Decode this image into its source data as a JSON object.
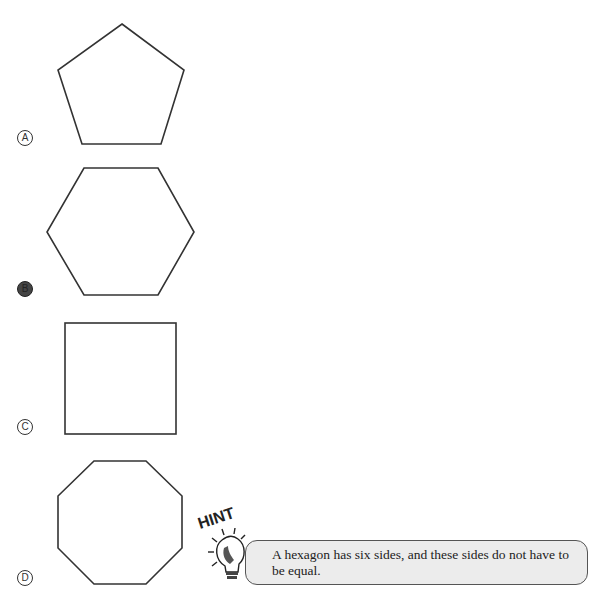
{
  "question": {
    "choices": [
      {
        "letter": "A",
        "shape": "pentagon",
        "selected": false
      },
      {
        "letter": "B",
        "shape": "hexagon",
        "selected": true
      },
      {
        "letter": "C",
        "shape": "square",
        "selected": false
      },
      {
        "letter": "D",
        "shape": "octagon",
        "selected": false
      }
    ]
  },
  "hint": {
    "title": "HINT",
    "icon": "lightbulb-icon",
    "text": "A hexagon has six sides, and these sides do not have to be equal."
  },
  "colors": {
    "stroke": "#333333",
    "hint_fill": "#ececec",
    "hint_border": "#555555"
  }
}
